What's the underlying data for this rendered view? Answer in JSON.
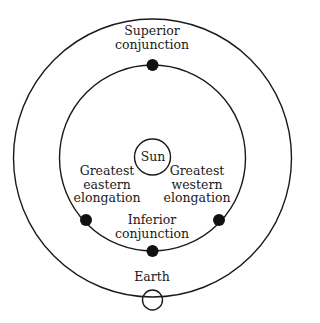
{
  "diagram": {
    "colors": {
      "stroke": "#1a1a1a",
      "background": "#ffffff"
    },
    "bodies": {
      "sun": {
        "label": "Sun"
      },
      "earth": {
        "label": "Earth"
      }
    },
    "positions": [
      {
        "id": "superior-conjunction",
        "lines": [
          "Superior",
          "conjunction"
        ]
      },
      {
        "id": "greatest-eastern-elongation",
        "lines": [
          "Greatest",
          "eastern",
          "elongation"
        ]
      },
      {
        "id": "greatest-western-elongation",
        "lines": [
          "Greatest",
          "western",
          "elongation"
        ]
      },
      {
        "id": "inferior-conjunction",
        "lines": [
          "Inferior",
          "conjunction"
        ]
      }
    ]
  }
}
